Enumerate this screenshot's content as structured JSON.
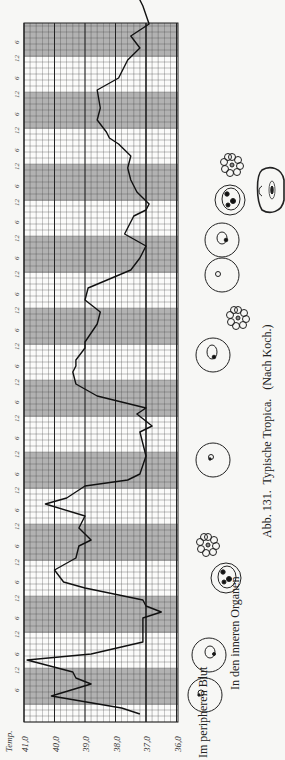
{
  "figure": {
    "caption_number": "Abb. 131.",
    "caption_title": "Typische Tropica.",
    "caption_source": "(Nach Koch.)",
    "label_peripheral": "Im peripheren Blut",
    "label_organs": "In den inneren Organen"
  },
  "colors": {
    "paper": "#f7f7f5",
    "grid_line": "#444444",
    "night_band": "#9a9a9a",
    "curve": "#111111"
  },
  "chart_data": {
    "type": "line",
    "orientation": "rotated 90° counter-clockwise (time runs bottom→top, temperature left→right decreasing)",
    "ylabel": "Temp.",
    "xlabel": "Zeit (6-Stunden-Intervalle)",
    "temp_ticks": [
      "41,0",
      "40,0",
      "39,0",
      "38,0",
      "37,0",
      "36,0"
    ],
    "temp_range": [
      36.0,
      41.0
    ],
    "time_tick_labels_pattern": [
      "6",
      "12"
    ],
    "time_step_hours": 6,
    "grid": true,
    "night_bands": "shaded 6 p.m.–6 a.m.",
    "emphasized_line": 37.0,
    "x_hours": [
      0,
      2,
      6,
      10,
      12,
      14,
      18,
      20,
      24,
      32,
      34,
      36,
      38,
      42,
      44,
      48,
      52,
      56,
      58,
      62,
      66,
      70,
      72,
      76,
      78,
      80,
      86,
      94,
      96,
      100,
      102,
      106,
      110,
      114,
      116,
      118,
      122,
      124,
      130,
      134,
      138,
      142,
      148,
      152,
      156,
      160,
      166,
      168,
      170,
      174,
      178,
      182,
      186,
      190,
      192,
      194,
      198,
      202,
      208,
      212,
      218,
      222,
      226,
      230,
      236,
      240,
      246,
      250,
      254,
      256,
      258
    ],
    "values": [
      37.2,
      37.8,
      40.1,
      38.8,
      39.3,
      39.4,
      40.9,
      38.8,
      37.1,
      37.1,
      36.5,
      37.0,
      37.1,
      39.0,
      39.7,
      40.0,
      39.3,
      39.2,
      38.8,
      39.2,
      39.0,
      40.3,
      39.6,
      39.0,
      37.6,
      37.2,
      37.0,
      37.2,
      36.8,
      37.3,
      37.0,
      38.6,
      39.3,
      39.4,
      39.3,
      39.3,
      39.0,
      39.0,
      38.6,
      38.5,
      39.0,
      38.9,
      37.5,
      37.2,
      37.0,
      37.7,
      37.4,
      37.0,
      36.9,
      37.3,
      37.5,
      37.6,
      37.5,
      37.9,
      38.2,
      38.3,
      38.6,
      38.5,
      38.6,
      37.9,
      37.6,
      37.2,
      37.5,
      36.9,
      37.1,
      37.3,
      36.6,
      37.2,
      36.6,
      36.9,
      37.2
    ]
  },
  "layout": {
    "grid_left": 24,
    "grid_right": 178,
    "grid_top": 23,
    "grid_bottom": 722,
    "px_per_degree": 30.5,
    "px_per_6h": 18
  }
}
